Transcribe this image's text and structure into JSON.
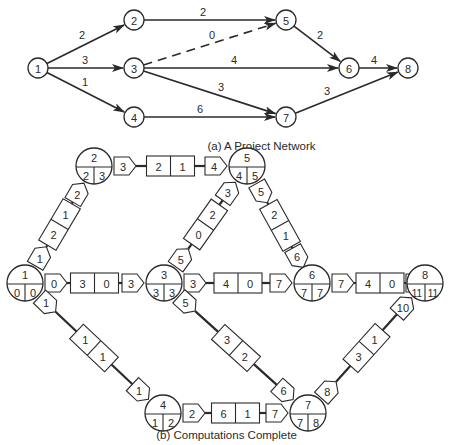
{
  "colors": {
    "ink": "#2a2a2a",
    "background": "#ffffff"
  },
  "part_a": {
    "caption": "(a)  A Project Network",
    "nodes": [
      {
        "id": "1",
        "x": 38,
        "y": 68
      },
      {
        "id": "2",
        "x": 134,
        "y": 20
      },
      {
        "id": "3",
        "x": 134,
        "y": 68
      },
      {
        "id": "4",
        "x": 134,
        "y": 117
      },
      {
        "id": "5",
        "x": 286,
        "y": 20
      },
      {
        "id": "6",
        "x": 349,
        "y": 68
      },
      {
        "id": "7",
        "x": 286,
        "y": 117
      },
      {
        "id": "8",
        "x": 408,
        "y": 68
      }
    ],
    "edges": [
      {
        "from": "1",
        "to": "2",
        "duration": "2",
        "dashed": false,
        "lx": 82,
        "ly": 35
      },
      {
        "from": "1",
        "to": "3",
        "duration": "3",
        "dashed": false,
        "lx": 85,
        "ly": 60
      },
      {
        "from": "1",
        "to": "4",
        "duration": "1",
        "dashed": false,
        "lx": 85,
        "ly": 82
      },
      {
        "from": "2",
        "to": "5",
        "duration": "2",
        "dashed": false,
        "lx": 203,
        "ly": 12
      },
      {
        "from": "3",
        "to": "5",
        "duration": "0",
        "dashed": true,
        "lx": 212,
        "ly": 35
      },
      {
        "from": "3",
        "to": "6",
        "duration": "4",
        "dashed": false,
        "lx": 234,
        "ly": 60
      },
      {
        "from": "3",
        "to": "7",
        "duration": "3",
        "dashed": false,
        "lx": 221,
        "ly": 87
      },
      {
        "from": "4",
        "to": "7",
        "duration": "6",
        "dashed": false,
        "lx": 200,
        "ly": 109
      },
      {
        "from": "5",
        "to": "6",
        "duration": "2",
        "dashed": false,
        "lx": 320,
        "ly": 35
      },
      {
        "from": "6",
        "to": "8",
        "duration": "4",
        "dashed": false,
        "lx": 374,
        "ly": 60
      },
      {
        "from": "7",
        "to": "8",
        "duration": "3",
        "dashed": false,
        "lx": 327,
        "ly": 91
      }
    ]
  },
  "part_b": {
    "caption": "(b)  Computations Complete",
    "nodes": [
      {
        "id": "1",
        "es": "0",
        "lf": "0",
        "x": 25,
        "y": 283
      },
      {
        "id": "2",
        "es": "2",
        "lf": "3",
        "x": 94,
        "y": 166
      },
      {
        "id": "3",
        "es": "3",
        "lf": "3",
        "x": 164,
        "y": 283
      },
      {
        "id": "4",
        "es": "1",
        "lf": "2",
        "x": 163,
        "y": 413
      },
      {
        "id": "5",
        "es": "4",
        "lf": "5",
        "x": 247,
        "y": 166
      },
      {
        "id": "6",
        "es": "7",
        "lf": "7",
        "x": 312,
        "y": 283
      },
      {
        "id": "7",
        "es": "7",
        "lf": "8",
        "x": 308,
        "y": 413
      },
      {
        "id": "8",
        "es": "11",
        "lf": "11",
        "x": 425,
        "y": 283
      }
    ],
    "activities": [
      {
        "from": "1",
        "to": "2",
        "start_tag": "1",
        "duration": "2",
        "slack": "1",
        "end_tag": "2"
      },
      {
        "from": "1",
        "to": "3",
        "start_tag": "0",
        "duration": "3",
        "slack": "0",
        "end_tag": "3"
      },
      {
        "from": "1",
        "to": "4",
        "start_tag": "1",
        "duration": "1",
        "slack": "1",
        "end_tag": "1"
      },
      {
        "from": "2",
        "to": "5",
        "start_tag": "3",
        "duration": "2",
        "slack": "1",
        "end_tag": "4"
      },
      {
        "from": "3",
        "to": "5",
        "start_tag": "5",
        "duration": "0",
        "slack": "2",
        "end_tag": "3"
      },
      {
        "from": "3",
        "to": "6",
        "start_tag": "3",
        "duration": "4",
        "slack": "0",
        "end_tag": "7"
      },
      {
        "from": "3",
        "to": "7",
        "start_tag": "5",
        "duration": "3",
        "slack": "2",
        "end_tag": "6"
      },
      {
        "from": "4",
        "to": "7",
        "start_tag": "2",
        "duration": "6",
        "slack": "1",
        "end_tag": "7"
      },
      {
        "from": "5",
        "to": "6",
        "start_tag": "5",
        "duration": "2",
        "slack": "1",
        "end_tag": "6"
      },
      {
        "from": "6",
        "to": "8",
        "start_tag": "7",
        "duration": "4",
        "slack": "0",
        "end_tag": "11"
      },
      {
        "from": "7",
        "to": "8",
        "start_tag": "8",
        "duration": "3",
        "slack": "1",
        "end_tag": "10"
      }
    ]
  }
}
